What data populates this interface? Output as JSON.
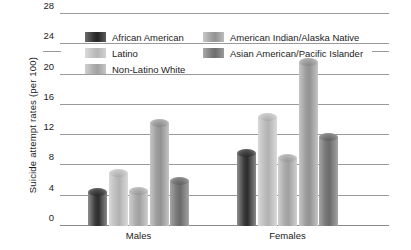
{
  "chart_data": {
    "type": "bar",
    "title": "",
    "subtitle": "",
    "xlabel": "",
    "ylabel": "Suicide attempt rates (per 100)",
    "categories": [
      "Males",
      "Females"
    ],
    "ylim": [
      0,
      28
    ],
    "yticks": [
      0,
      4,
      8,
      12,
      16,
      20,
      24,
      28
    ],
    "ytick_labels": [
      "0",
      "4",
      "8",
      "12",
      "16",
      "20",
      "24",
      "28"
    ],
    "grid": true,
    "legend_position": "top-inside",
    "series": [
      {
        "name": "African American",
        "values": [
          4.5,
          9.7
        ],
        "color": "#2f2f2f"
      },
      {
        "name": "Latino",
        "values": [
          7.0,
          14.4
        ],
        "color": "#bdbdbd"
      },
      {
        "name": "Non-Latino White",
        "values": [
          4.6,
          9.0
        ],
        "color": "#aaaaaa"
      },
      {
        "name": "American Indian/Alaska Native",
        "values": [
          13.6,
          21.6
        ],
        "color": "#9c9c9c"
      },
      {
        "name": "Asian American/Pacific Islander",
        "values": [
          6.0,
          11.8
        ],
        "color": "#767676"
      }
    ]
  },
  "legend": {
    "items": [
      {
        "label": "African American"
      },
      {
        "label": "American Indian/Alaska Native"
      },
      {
        "label": "Latino"
      },
      {
        "label": "Asian American/Pacific Islander"
      },
      {
        "label": "Non-Latino White"
      }
    ]
  }
}
